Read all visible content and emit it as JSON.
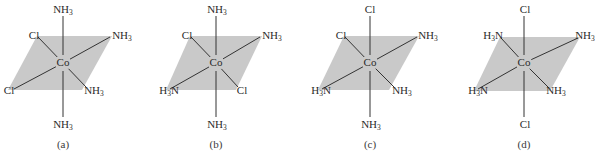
{
  "figure": {
    "colors": {
      "plane": "#c9c9c9",
      "bond": "#333333",
      "text": "#2a2a2a"
    },
    "structures": [
      {
        "id": "a",
        "caption": "(a)",
        "center": {
          "label": "Co",
          "x": 63,
          "y": 63
        },
        "plane": [
          [
            37,
            36
          ],
          [
            112,
            36
          ],
          [
            82,
            90
          ],
          [
            8,
            90
          ]
        ],
        "ligands": {
          "top": {
            "text": "NH",
            "sub": "3",
            "pre": "",
            "x": 63,
            "y": 9,
            "bondEnd": [
              63,
              16
            ]
          },
          "bottom": {
            "text": "NH",
            "sub": "3",
            "pre": "",
            "x": 63,
            "y": 124,
            "bondEnd": [
              63,
              117
            ]
          },
          "back_left": {
            "text": "Cl",
            "sub": "",
            "pre": "",
            "x": 34,
            "y": 35,
            "bondEnd": [
              38,
              37
            ]
          },
          "back_right": {
            "text": "NH",
            "sub": "3",
            "pre": "",
            "x": 122,
            "y": 35,
            "bondEnd": [
              110,
              37
            ]
          },
          "front_left": {
            "text": "Cl",
            "sub": "",
            "pre": "",
            "x": 9,
            "y": 90,
            "bondEnd": [
              14,
              89
            ]
          },
          "front_right": {
            "text": "NH",
            "sub": "3",
            "pre": "",
            "x": 94,
            "y": 90,
            "bondEnd": [
              86,
              87
            ]
          }
        }
      },
      {
        "id": "b",
        "caption": "(b)",
        "center": {
          "label": "Co",
          "x": 216,
          "y": 63
        },
        "plane": [
          [
            190,
            36
          ],
          [
            262,
            36
          ],
          [
            236,
            90
          ],
          [
            166,
            90
          ]
        ],
        "ligands": {
          "top": {
            "text": "NH",
            "sub": "3",
            "pre": "",
            "x": 217,
            "y": 9,
            "bondEnd": [
              216,
              16
            ]
          },
          "bottom": {
            "text": "NH",
            "sub": "3",
            "pre": "",
            "x": 217,
            "y": 124,
            "bondEnd": [
              216,
              117
            ]
          },
          "back_left": {
            "text": "Cl",
            "sub": "",
            "pre": "",
            "x": 187,
            "y": 35,
            "bondEnd": [
              191,
              37
            ]
          },
          "back_right": {
            "text": "NH",
            "sub": "3",
            "pre": "",
            "x": 272,
            "y": 35,
            "bondEnd": [
              260,
              37
            ]
          },
          "front_left": {
            "text": "N",
            "sub": "3",
            "pre": "H",
            "x": 169,
            "y": 90,
            "bondEnd": [
              170,
              89
            ]
          },
          "front_right": {
            "text": "Cl",
            "sub": "",
            "pre": "",
            "x": 242,
            "y": 90,
            "bondEnd": [
              238,
              87
            ]
          }
        }
      },
      {
        "id": "c",
        "caption": "(c)",
        "center": {
          "label": "Co",
          "x": 370,
          "y": 63
        },
        "plane": [
          [
            344,
            36
          ],
          [
            419,
            36
          ],
          [
            389,
            90
          ],
          [
            318,
            90
          ]
        ],
        "ligands": {
          "top": {
            "text": "Cl",
            "sub": "",
            "pre": "",
            "x": 370,
            "y": 9,
            "bondEnd": [
              370,
              16
            ]
          },
          "bottom": {
            "text": "NH",
            "sub": "3",
            "pre": "",
            "x": 371,
            "y": 124,
            "bondEnd": [
              370,
              117
            ]
          },
          "back_left": {
            "text": "Cl",
            "sub": "",
            "pre": "",
            "x": 341,
            "y": 35,
            "bondEnd": [
              345,
              37
            ]
          },
          "back_right": {
            "text": "NH",
            "sub": "3",
            "pre": "",
            "x": 428,
            "y": 35,
            "bondEnd": [
              417,
              37
            ]
          },
          "front_left": {
            "text": "N",
            "sub": "3",
            "pre": "H",
            "x": 321,
            "y": 90,
            "bondEnd": [
              322,
              89
            ]
          },
          "front_right": {
            "text": "NH",
            "sub": "3",
            "pre": "",
            "x": 402,
            "y": 90,
            "bondEnd": [
              394,
              87
            ]
          }
        }
      },
      {
        "id": "d",
        "caption": "(d)",
        "center": {
          "label": "Co",
          "x": 524,
          "y": 63
        },
        "plane": [
          [
            500,
            37
          ],
          [
            580,
            37
          ],
          [
            550,
            91
          ],
          [
            474,
            91
          ]
        ],
        "ligands": {
          "top": {
            "text": "Cl",
            "sub": "",
            "pre": "",
            "x": 525,
            "y": 9,
            "bondEnd": [
              524,
              16
            ]
          },
          "bottom": {
            "text": "Cl",
            "sub": "",
            "pre": "",
            "x": 525,
            "y": 124,
            "bondEnd": [
              524,
              117
            ]
          },
          "back_left": {
            "text": "N",
            "sub": "3",
            "pre": "H",
            "x": 493,
            "y": 35,
            "bondEnd": [
              501,
              38
            ]
          },
          "back_right": {
            "text": "NH",
            "sub": "3",
            "pre": "",
            "x": 585,
            "y": 35,
            "bondEnd": [
              578,
              38
            ]
          },
          "front_left": {
            "text": "N",
            "sub": "3",
            "pre": "H",
            "x": 478,
            "y": 90,
            "bondEnd": [
              478,
              89
            ]
          },
          "front_right": {
            "text": "NH",
            "sub": "3",
            "pre": "",
            "x": 556,
            "y": 90,
            "bondEnd": [
              549,
              88
            ]
          }
        }
      }
    ]
  }
}
